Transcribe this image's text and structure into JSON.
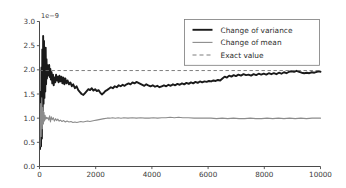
{
  "chart_data": {
    "type": "line",
    "title": "",
    "xlabel": "",
    "ylabel": "",
    "y_offset_text": "1e-9",
    "y_offset_multiplier": 1e-09,
    "xlim": [
      0,
      10000
    ],
    "ylim": [
      0.0,
      3.0
    ],
    "xticks": [
      0,
      2000,
      4000,
      6000,
      8000,
      10000
    ],
    "xtick_labels": [
      "0",
      "2000",
      "4000",
      "6000",
      "8000",
      "10000"
    ],
    "yticks": [
      0.0,
      0.5,
      1.0,
      1.5,
      2.0,
      2.5,
      3.0
    ],
    "ytick_labels": [
      "0.0",
      "0.5",
      "1.0",
      "1.5",
      "2.0",
      "2.5",
      "3.0"
    ],
    "grid": false,
    "legend_position": "upper right",
    "legend": [
      {
        "label": "Change of variance",
        "color": "#1a1a1a",
        "style": "solid",
        "width": 1.9
      },
      {
        "label": "Change of mean",
        "color": "#8c8c8c",
        "style": "solid",
        "width": 1.1
      },
      {
        "label": "Exact value",
        "color": "#6e6e6e",
        "style": "dashed",
        "width": 0.9
      }
    ],
    "series": [
      {
        "name": "Change of variance",
        "color": "#1a1a1a",
        "style": "solid",
        "x": [
          20,
          40,
          55,
          70,
          85,
          100,
          115,
          130,
          145,
          160,
          175,
          190,
          205,
          220,
          235,
          250,
          265,
          280,
          295,
          310,
          325,
          345,
          365,
          385,
          405,
          430,
          455,
          480,
          505,
          530,
          560,
          590,
          620,
          650,
          680,
          710,
          745,
          780,
          815,
          850,
          885,
          920,
          960,
          1000,
          1050,
          1100,
          1150,
          1200,
          1260,
          1320,
          1380,
          1440,
          1500,
          1560,
          1620,
          1680,
          1740,
          1800,
          1860,
          1920,
          1980,
          2040,
          2100,
          2160,
          2220,
          2280,
          2340,
          2400,
          2470,
          2540,
          2610,
          2680,
          2750,
          2820,
          2890,
          2960,
          3030,
          3100,
          3170,
          3240,
          3310,
          3380,
          3450,
          3520,
          3590,
          3660,
          3730,
          3800,
          3870,
          3950,
          4030,
          4110,
          4190,
          4270,
          4350,
          4430,
          4510,
          4590,
          4670,
          4750,
          4830,
          4910,
          4990,
          5070,
          5150,
          5230,
          5310,
          5390,
          5470,
          5550,
          5630,
          5710,
          5790,
          5870,
          5950,
          6030,
          6110,
          6190,
          6270,
          6350,
          6430,
          6510,
          6590,
          6670,
          6750,
          6830,
          6910,
          6990,
          7080,
          7170,
          7260,
          7350,
          7440,
          7530,
          7620,
          7710,
          7800,
          7890,
          7980,
          8070,
          8160,
          8250,
          8340,
          8430,
          8520,
          8610,
          8700,
          8790,
          8880,
          8970,
          9060,
          9150,
          9240,
          9330,
          9420,
          9510,
          9600,
          9690,
          9780,
          9870,
          9950,
          10000
        ],
        "y": [
          0.36,
          1.55,
          0.42,
          2.05,
          0.58,
          2.42,
          1.15,
          2.7,
          1.3,
          2.6,
          1.42,
          2.3,
          1.55,
          2.46,
          1.7,
          2.22,
          1.82,
          2.1,
          1.88,
          2.05,
          1.92,
          2.1,
          1.85,
          2.02,
          1.8,
          1.95,
          1.72,
          1.9,
          1.68,
          1.84,
          1.74,
          1.9,
          1.78,
          1.86,
          1.74,
          1.88,
          1.76,
          1.86,
          1.72,
          1.84,
          1.7,
          1.82,
          1.72,
          1.78,
          1.7,
          1.74,
          1.66,
          1.7,
          1.62,
          1.66,
          1.58,
          1.54,
          1.5,
          1.48,
          1.52,
          1.56,
          1.6,
          1.58,
          1.62,
          1.57,
          1.6,
          1.56,
          1.58,
          1.53,
          1.49,
          1.52,
          1.56,
          1.58,
          1.61,
          1.64,
          1.62,
          1.66,
          1.64,
          1.68,
          1.66,
          1.69,
          1.67,
          1.7,
          1.72,
          1.7,
          1.74,
          1.72,
          1.75,
          1.73,
          1.71,
          1.69,
          1.67,
          1.7,
          1.68,
          1.66,
          1.68,
          1.65,
          1.67,
          1.64,
          1.66,
          1.68,
          1.66,
          1.69,
          1.67,
          1.7,
          1.68,
          1.71,
          1.69,
          1.72,
          1.7,
          1.73,
          1.71,
          1.74,
          1.72,
          1.75,
          1.73,
          1.76,
          1.74,
          1.76,
          1.75,
          1.77,
          1.76,
          1.78,
          1.77,
          1.79,
          1.78,
          1.82,
          1.86,
          1.84,
          1.88,
          1.86,
          1.89,
          1.87,
          1.9,
          1.88,
          1.91,
          1.89,
          1.9,
          1.88,
          1.91,
          1.89,
          1.92,
          1.9,
          1.92,
          1.9,
          1.93,
          1.91,
          1.93,
          1.91,
          1.94,
          1.92,
          1.95,
          1.93,
          1.96,
          1.97,
          1.96,
          1.98,
          1.96,
          1.94,
          1.93,
          1.94,
          1.93,
          1.95,
          1.94,
          1.96,
          1.97,
          1.96
        ]
      },
      {
        "name": "Change of mean",
        "color": "#8c8c8c",
        "style": "solid",
        "x": [
          20,
          40,
          60,
          80,
          100,
          120,
          140,
          160,
          180,
          200,
          220,
          245,
          270,
          300,
          330,
          360,
          390,
          420,
          450,
          490,
          530,
          570,
          610,
          650,
          700,
          750,
          800,
          860,
          920,
          980,
          1050,
          1120,
          1190,
          1260,
          1330,
          1400,
          1470,
          1550,
          1630,
          1710,
          1790,
          1870,
          1950,
          2030,
          2120,
          2210,
          2300,
          2400,
          2500,
          2600,
          2700,
          2800,
          2900,
          3000,
          3150,
          3300,
          3450,
          3600,
          3750,
          3900,
          4050,
          4200,
          4350,
          4500,
          4650,
          4800,
          4950,
          5100,
          5300,
          5500,
          5700,
          5900,
          6100,
          6300,
          6500,
          6700,
          6900,
          7100,
          7300,
          7500,
          7700,
          7900,
          8100,
          8300,
          8500,
          8700,
          8900,
          9100,
          9300,
          9500,
          9700,
          9900,
          10000
        ],
        "y": [
          0.42,
          1.3,
          0.62,
          1.42,
          0.78,
          1.22,
          0.88,
          1.12,
          0.94,
          1.06,
          0.98,
          1.02,
          0.99,
          1.01,
          0.96,
          1.05,
          0.92,
          1.03,
          0.97,
          1.01,
          0.94,
          0.99,
          0.95,
          0.98,
          0.94,
          0.96,
          0.93,
          0.95,
          0.92,
          0.94,
          0.92,
          0.93,
          0.91,
          0.92,
          0.91,
          0.92,
          0.93,
          0.92,
          0.93,
          0.94,
          0.93,
          0.94,
          0.95,
          0.96,
          0.97,
          0.98,
          0.99,
          1.0,
          1.0,
          1.01,
          1.0,
          1.01,
          1.0,
          1.01,
          1.0,
          1.01,
          1.0,
          1.01,
          1.0,
          1.0,
          1.01,
          1.0,
          1.01,
          1.01,
          1.02,
          1.01,
          1.02,
          1.01,
          1.01,
          1.0,
          1.0,
          1.0,
          1.0,
          0.99,
          1.0,
          0.99,
          1.0,
          0.99,
          0.99,
          1.0,
          0.99,
          0.99,
          1.0,
          0.99,
          1.0,
          0.99,
          1.0,
          0.99,
          1.0,
          0.99,
          1.0,
          1.0,
          1.0
        ]
      }
    ],
    "reference_lines": [
      {
        "name": "Exact value",
        "orientation": "horizontal",
        "value": 1.985,
        "color": "#6e6e6e",
        "style": "dashed"
      }
    ]
  }
}
